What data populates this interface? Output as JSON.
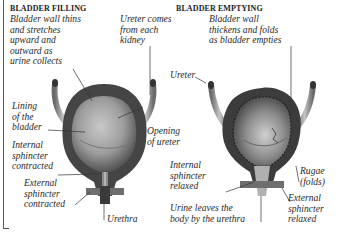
{
  "panels": [
    {
      "heading": "BLADDER FILLING",
      "labels": {
        "wall": "Bladder wall thins\nand stretches\nupward and\noutward as\nurine collects",
        "ureter": "Ureter comes\nfrom each\nkidney",
        "lining": "Lining\nof the\nbladder",
        "opening": "Opening\nof ureter",
        "internal": "Internal\nsphincter\ncontracted",
        "external": "External\nsphincter\ncontracted",
        "urethra": "Urethra"
      }
    },
    {
      "heading": "BLADDER EMPTYING",
      "labels": {
        "wall": "Bladder wall\nthickens and folds\nas bladder empties",
        "ureter": "Ureter",
        "internal": "Internal\nsphincter\nrelaxed",
        "rugae": "Rugae\n(folds)",
        "external": "External\nsphincter\nrelaxed",
        "urine": "Urine leaves the\nbody by the urethra"
      }
    }
  ],
  "colors": {
    "wall": "#4a4a4a",
    "lining_light": "#b5b5b5",
    "lining_dark": "#5a5a5a",
    "ureter": "#9a9a9a",
    "sphincter": "#6e6e6e",
    "leader": "#333333"
  }
}
